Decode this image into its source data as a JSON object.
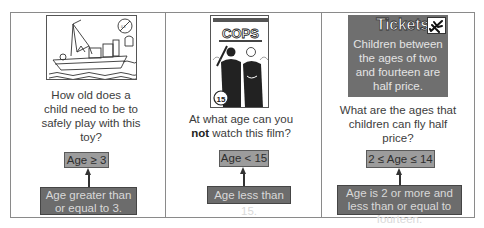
{
  "panels": [
    {
      "image": {
        "subject": "toy-boat",
        "warning_badge": "0-3"
      },
      "question": "How old does a child need to be to safely play with this toy?",
      "inequality": "Age ≥ 3",
      "description": "Age greater than or equal to 3."
    },
    {
      "image": {
        "subject": "film-poster",
        "title": "COPS",
        "rating": "15"
      },
      "question_pre": "At what age can you",
      "question_bold": "not",
      "question_post": "watch this film?",
      "inequality": "Age < 15",
      "description": "Age less than 15."
    },
    {
      "image": {
        "subject": "tickets-sign",
        "title": "Tickets",
        "body": "Children between the ages of two and fourteen are half price."
      },
      "question": "What are the ages that children can fly half price?",
      "inequality": "2 ≤ Age ≤ 14",
      "description": "Age is 2 or more and less than or equal to fourteen."
    }
  ],
  "colors": {
    "border": "#8a8a8a",
    "inequality_fill": "#9c9c9c",
    "description_fill": "#6c6c6c",
    "description_text": "#d9d9d9",
    "tickets_fill": "#6f6f6f"
  }
}
